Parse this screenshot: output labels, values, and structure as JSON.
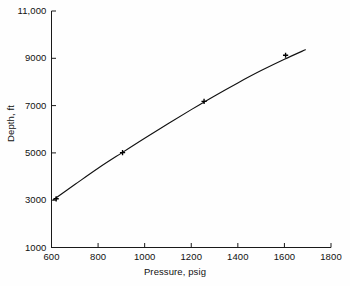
{
  "chart_data": {
    "type": "line",
    "title": "",
    "xlabel": "Pressure, psig",
    "ylabel": "Depth, ft",
    "xlim": [
      600,
      1800
    ],
    "ylim": [
      1000,
      11000
    ],
    "xticks": [
      "600",
      "800",
      "1000",
      "1200",
      "1400",
      "1600",
      "1800"
    ],
    "yticks": [
      "1000",
      "3000",
      "5000",
      "7000",
      "9000",
      "11,000"
    ],
    "grid": false,
    "legend": "none",
    "series": [
      {
        "name": "Depth vs Pressure",
        "marker": "plus",
        "x": [
          620,
          905,
          1255,
          1605
        ],
        "y": [
          3060,
          5010,
          7180,
          9130
        ]
      }
    ],
    "curve": {
      "name": "fitted-curve",
      "x": [
        608,
        700,
        800,
        900,
        1000,
        1100,
        1200,
        1300,
        1400,
        1500,
        1600,
        1690
      ],
      "y": [
        3020,
        3660,
        4350,
        4990,
        5620,
        6230,
        6830,
        7410,
        7960,
        8480,
        8960,
        9360
      ]
    }
  },
  "style": {
    "axis_color": "#1a1a1a",
    "curve_color": "#111111",
    "marker_color": "#000000",
    "background": "#fefefe"
  }
}
